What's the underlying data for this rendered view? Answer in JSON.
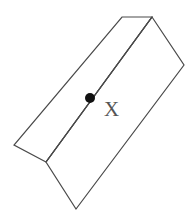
{
  "diagram": {
    "colors": {
      "stroke": "#4a4a4a",
      "point": "#111111",
      "label": "#555555",
      "background": "#ffffff"
    },
    "vertices": {
      "top_left": [
        122,
        17
      ],
      "top_ridge": [
        152,
        17
      ],
      "right": [
        184,
        65
      ],
      "left": [
        14,
        145
      ],
      "bottom_ridge": [
        46,
        162
      ],
      "bottom": [
        76,
        209
      ]
    },
    "point": {
      "label": "X",
      "position": [
        90,
        98
      ],
      "radius": 5
    },
    "label_position": [
      104,
      116
    ]
  }
}
